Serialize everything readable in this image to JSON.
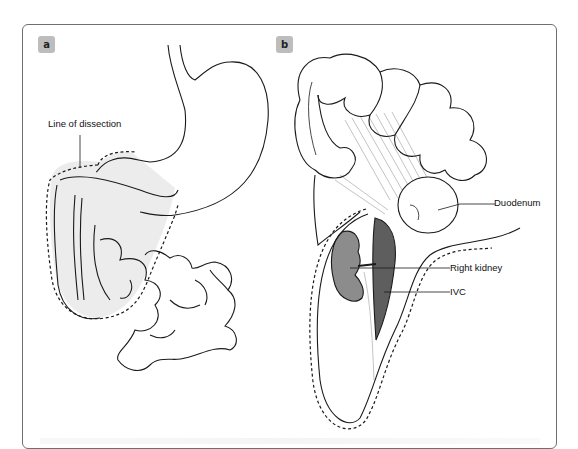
{
  "figure": {
    "panels": [
      {
        "id": "a",
        "badge": "a"
      },
      {
        "id": "b",
        "badge": "b"
      }
    ],
    "labels": {
      "line_of_dissection": "Line of dissection",
      "duodenum": "Duodenum",
      "right_kidney": "Right kidney",
      "ivc": "IVC"
    },
    "colors": {
      "badge_bg": "#bdbdbd",
      "dissection_region": "#ececec",
      "kidney": "#8c8c8c",
      "ivc": "#5e5e5e",
      "outline": "#1a1a1a",
      "frame": "#6f6f6f"
    }
  }
}
